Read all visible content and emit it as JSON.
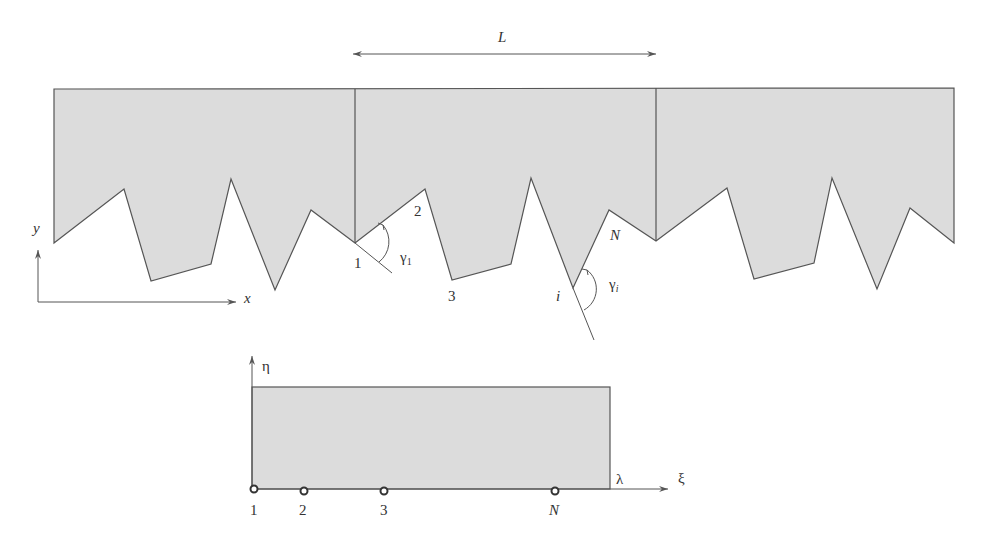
{
  "figure": {
    "colors": {
      "fill": "#dcdcdc",
      "stroke": "#555555",
      "text": "#333333"
    },
    "top_panel": {
      "period_label": "L",
      "axis_x_label": "x",
      "axis_y_label": "y",
      "node_labels": {
        "n1": "1",
        "n2": "2",
        "n3": "3",
        "ni": "i",
        "nN": "N"
      },
      "angle_labels": {
        "g1": "γ",
        "g1_sub": "1",
        "gi": "γ",
        "gi_sub": "i"
      }
    },
    "bottom_panel": {
      "axis_xi_label": "ξ",
      "axis_eta_label": "η",
      "lambda_label": "λ",
      "node_labels": [
        "1",
        "2",
        "3",
        "N"
      ]
    }
  }
}
